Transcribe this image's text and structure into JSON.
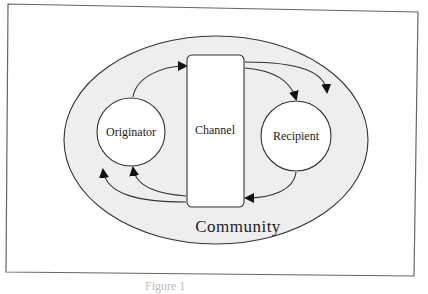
{
  "diagram": {
    "type": "communication-model",
    "colors": {
      "frame": "#555555",
      "community_fill": "#eeeeee",
      "node_fill": "#ffffff",
      "stroke": "#333333",
      "arrow": "#111111"
    },
    "nodes": {
      "community": {
        "label": "Community"
      },
      "originator": {
        "label": "Originator"
      },
      "channel": {
        "label": "Channel"
      },
      "recipient": {
        "label": "Recipient"
      }
    },
    "edges": [
      {
        "from": "originator",
        "to": "channel",
        "position": "top"
      },
      {
        "from": "channel",
        "to": "recipient",
        "position": "top"
      },
      {
        "from": "channel",
        "to": "community",
        "position": "top-right"
      },
      {
        "from": "recipient",
        "to": "channel",
        "position": "bottom"
      },
      {
        "from": "channel",
        "to": "originator",
        "position": "bottom"
      },
      {
        "from": "channel",
        "to": "community",
        "position": "bottom-left"
      }
    ]
  },
  "caption": {
    "text": "Figure 1"
  }
}
